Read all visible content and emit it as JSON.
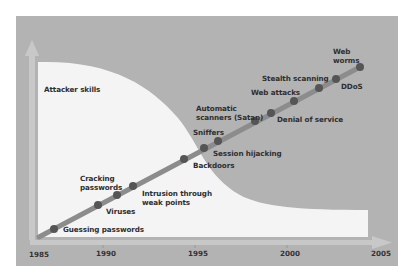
{
  "y_axis_label": "Attacker skills",
  "x_axis": {
    "ticks": [
      "1985",
      "1990",
      "1995",
      "2000",
      "2005"
    ]
  },
  "events": [
    {
      "label": "Guessing passwords"
    },
    {
      "label": "Viruses"
    },
    {
      "label": "Cracking passwords"
    },
    {
      "label": "Intrusion through weak points"
    },
    {
      "label": "Backdoors"
    },
    {
      "label": "Session hijacking"
    },
    {
      "label": "Sniffers"
    },
    {
      "label": "Automatic scanners (Satan)"
    },
    {
      "label": "Denial of service"
    },
    {
      "label": "Web attacks"
    },
    {
      "label": "Stealth scanning"
    },
    {
      "label": "DDoS"
    },
    {
      "label": "Web worms"
    }
  ],
  "labels": {
    "guessing": "Guessing passwords",
    "viruses": "Viruses",
    "cracking_1": "Cracking",
    "cracking_2": "passwords",
    "intrusion_1": "Intrusion through",
    "intrusion_2": "weak points",
    "backdoors": "Backdoors",
    "session": "Session hijacking",
    "sniffers": "Sniffers",
    "scanners_1": "Automatic",
    "scanners_2": "scanners (Satan)",
    "dos": "Denial of service",
    "web_attacks": "Web attacks",
    "stealth": "Stealth scanning",
    "ddos": "DDoS",
    "worms_1": "Web",
    "worms_2": "worms"
  },
  "colors": {
    "background": "#b3b3b3",
    "skills_area": "#f4f4f4",
    "trend_line": "#8a8a8a",
    "dots": "#555555",
    "axis": "#c9c9c9"
  }
}
